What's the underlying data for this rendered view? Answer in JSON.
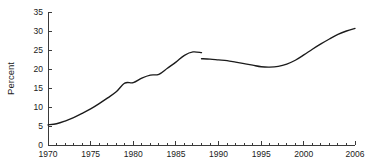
{
  "chart_data": {
    "type": "line",
    "title": "",
    "subtitle": "",
    "xlabel": "",
    "ylabel": "Percent",
    "xlim": [
      1970,
      2006
    ],
    "ylim": [
      0,
      35
    ],
    "grid": false,
    "legend": null,
    "line_color": "#1b1b1b",
    "x_major_ticks": [
      1970,
      1975,
      1980,
      1985,
      1990,
      1995,
      2000,
      2006
    ],
    "x_major_tick_labels": [
      "1970",
      "1975",
      "1980",
      "1985",
      "1990",
      "1995",
      "2000",
      "2006"
    ],
    "x_minor_ticks": [
      1971,
      1972,
      1973,
      1974,
      1976,
      1977,
      1978,
      1979,
      1981,
      1982,
      1983,
      1984,
      1986,
      1987,
      1988,
      1989,
      1991,
      1992,
      1993,
      1994,
      1996,
      1997,
      1998,
      1999,
      2001,
      2002,
      2003,
      2004,
      2005
    ],
    "y_ticks": [
      0,
      5,
      10,
      15,
      20,
      25,
      30,
      35
    ],
    "y_tick_labels": [
      "0",
      "5",
      "10",
      "15",
      "20",
      "25",
      "30",
      "35"
    ],
    "series": [
      {
        "name": "segment-1970-1988",
        "x": [
          1970,
          1971,
          1972,
          1973,
          1974,
          1975,
          1976,
          1977,
          1978,
          1979,
          1980,
          1981,
          1982,
          1983,
          1984,
          1985,
          1986,
          1987,
          1988
        ],
        "values": [
          5.3,
          5.6,
          6.3,
          7.2,
          8.3,
          9.5,
          10.9,
          12.4,
          14.0,
          16.3,
          16.4,
          17.6,
          18.4,
          18.6,
          20.2,
          21.8,
          23.6,
          24.5,
          24.3
        ]
      },
      {
        "name": "segment-1988-2006",
        "x": [
          1988,
          1989,
          1990,
          1991,
          1992,
          1993,
          1994,
          1995,
          1996,
          1997,
          1998,
          1999,
          2000,
          2001,
          2002,
          2003,
          2004,
          2005,
          2006
        ],
        "values": [
          22.7,
          22.6,
          22.4,
          22.2,
          21.8,
          21.4,
          21.0,
          20.6,
          20.5,
          20.7,
          21.3,
          22.3,
          23.7,
          25.2,
          26.6,
          27.9,
          29.1,
          30.0,
          30.7
        ]
      }
    ],
    "annotations": [
      {
        "name": "series-break",
        "x": 1988,
        "note": "discontinuity between segments"
      }
    ]
  }
}
